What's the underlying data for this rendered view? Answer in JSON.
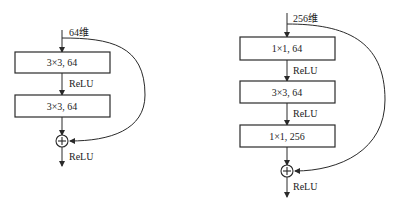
{
  "diagrams": [
    {
      "name": "basic-block",
      "input_label": "64维",
      "layers": [
        {
          "label": "3×3, 64"
        },
        {
          "label": "3×3, 64"
        }
      ],
      "activations": [
        "ReLU",
        "ReLU"
      ],
      "add_symbol": "+"
    },
    {
      "name": "bottleneck-block",
      "input_label": "256维",
      "layers": [
        {
          "label": "1×1, 64"
        },
        {
          "label": "3×3, 64"
        },
        {
          "label": "1×1, 256"
        }
      ],
      "activations": [
        "ReLU",
        "ReLU",
        "ReLU"
      ],
      "add_symbol": "+"
    }
  ]
}
